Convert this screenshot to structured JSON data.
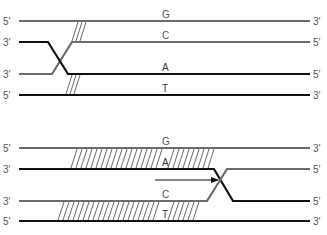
{
  "colors": {
    "gray_strand": "#6b6b6b",
    "black_strand": "#111111",
    "hatch": "#444444",
    "label": "#555555"
  },
  "top_panel": {
    "strands": [
      {
        "name": "G",
        "left_end": "5′",
        "right_end": "3′",
        "color": "gray"
      },
      {
        "name": "C",
        "left_end": "3′",
        "right_end": "5′",
        "color": "gray"
      },
      {
        "name": "A",
        "left_end": "3′",
        "right_end": "5′",
        "color": "black"
      },
      {
        "name": "T",
        "left_end": "5′",
        "right_end": "3′",
        "color": "black"
      }
    ]
  },
  "bottom_panel": {
    "strands": [
      {
        "name": "G",
        "left_end": "5′",
        "right_end": "3′",
        "color": "gray"
      },
      {
        "name": "A",
        "left_end": "3′",
        "right_end": "5′",
        "color": "black"
      },
      {
        "name": "C",
        "left_end": "3′",
        "right_end": "5′",
        "color": "gray"
      },
      {
        "name": "T",
        "left_end": "5′",
        "right_end": "3′",
        "color": "black"
      }
    ],
    "arrow": "branch-migration-arrow"
  }
}
